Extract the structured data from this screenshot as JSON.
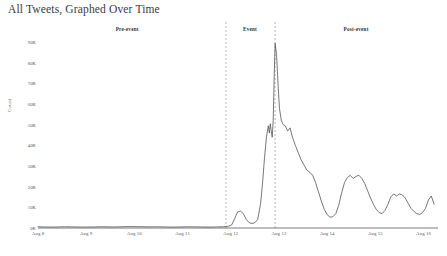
{
  "title": "All Tweets, Graphed Over Time",
  "axis": {
    "ylabel": "Count",
    "y_ticks": [
      "0K",
      "10K",
      "20K",
      "30K",
      "40K",
      "50K",
      "60K",
      "70K",
      "80K",
      "90K"
    ],
    "x_ticks": [
      "Aug 8",
      "Aug 9",
      "Aug 10",
      "Aug 11",
      "Aug 12",
      "Aug 13",
      "Aug 14",
      "Aug 15",
      "Aug 16"
    ]
  },
  "bands": [
    {
      "label": "Pre-event",
      "center_day": 9.85
    },
    {
      "label": "Event",
      "center_day": 12.4
    },
    {
      "label": "Post-event",
      "center_day": 14.6
    }
  ],
  "colors": {
    "line": "#555555",
    "divider": "#999999",
    "text": "#444444",
    "background": "#ffffff"
  },
  "chart_data": {
    "type": "line",
    "title": "All Tweets, Graphed Over Time",
    "xlabel": "",
    "ylabel": "Count",
    "grid": false,
    "legend": null,
    "xlim": [
      8,
      16.3
    ],
    "ylim": [
      0,
      93000
    ],
    "x_tick_values": [
      8,
      9,
      10,
      11,
      12,
      13,
      14,
      15,
      16
    ],
    "y_tick_values": [
      0,
      10000,
      20000,
      30000,
      40000,
      50000,
      60000,
      70000,
      80000,
      90000
    ],
    "annotations": [
      {
        "type": "vline",
        "x": 11.9,
        "style": "dashed",
        "label": "event-start"
      },
      {
        "type": "vline",
        "x": 12.92,
        "style": "dashed",
        "label": "event-peak"
      },
      {
        "type": "text",
        "x": 9.85,
        "label": "Pre-event"
      },
      {
        "type": "text",
        "x": 12.4,
        "label": "Event"
      },
      {
        "type": "text",
        "x": 14.6,
        "label": "Post-event"
      }
    ],
    "series": [
      {
        "name": "Tweets",
        "x": [
          8.0,
          8.12,
          8.25,
          8.4,
          8.55,
          8.7,
          8.85,
          9.0,
          9.15,
          9.3,
          9.45,
          9.6,
          9.75,
          9.9,
          10.05,
          10.2,
          10.35,
          10.5,
          10.65,
          10.8,
          10.95,
          11.1,
          11.25,
          11.4,
          11.55,
          11.7,
          11.85,
          11.9,
          11.96,
          12.02,
          12.08,
          12.14,
          12.2,
          12.26,
          12.32,
          12.38,
          12.44,
          12.5,
          12.56,
          12.62,
          12.66,
          12.7,
          12.74,
          12.78,
          12.8,
          12.82,
          12.84,
          12.86,
          12.88,
          12.9,
          12.92,
          12.95,
          12.98,
          13.01,
          13.05,
          13.09,
          13.13,
          13.18,
          13.23,
          13.28,
          13.34,
          13.4,
          13.46,
          13.52,
          13.58,
          13.64,
          13.7,
          13.76,
          13.82,
          13.88,
          13.94,
          14.0,
          14.06,
          14.12,
          14.18,
          14.24,
          14.3,
          14.36,
          14.42,
          14.48,
          14.54,
          14.6,
          14.66,
          14.72,
          14.78,
          14.84,
          14.9,
          14.96,
          15.02,
          15.08,
          15.14,
          15.2,
          15.26,
          15.32,
          15.38,
          15.44,
          15.5,
          15.56,
          15.62,
          15.68,
          15.74,
          15.8,
          15.86,
          15.92,
          15.98,
          16.04,
          16.1,
          16.16,
          16.22
        ],
        "values": [
          600,
          500,
          450,
          500,
          600,
          550,
          500,
          450,
          500,
          600,
          550,
          500,
          600,
          700,
          650,
          600,
          550,
          600,
          500,
          450,
          500,
          600,
          550,
          500,
          450,
          500,
          600,
          700,
          900,
          1500,
          4500,
          7800,
          8200,
          7000,
          4200,
          2600,
          2200,
          2600,
          4200,
          12000,
          22000,
          34000,
          44000,
          49500,
          46000,
          50500,
          47000,
          44000,
          52000,
          72000,
          89500,
          84000,
          70000,
          58000,
          52000,
          50000,
          49500,
          47000,
          48500,
          44000,
          40000,
          36500,
          33000,
          30500,
          28000,
          27000,
          25500,
          22000,
          17500,
          13000,
          9000,
          6500,
          5200,
          5500,
          7000,
          11000,
          17000,
          22000,
          24500,
          25500,
          24000,
          25000,
          25500,
          24000,
          21500,
          18000,
          14500,
          11500,
          9000,
          7500,
          7000,
          8500,
          11500,
          15000,
          16500,
          15500,
          16500,
          16000,
          14500,
          12000,
          9500,
          8000,
          7000,
          6500,
          7500,
          9500,
          13500,
          15500,
          11500
        ]
      }
    ]
  }
}
